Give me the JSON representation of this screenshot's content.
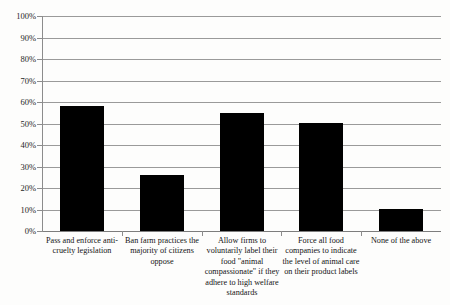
{
  "chart_data": {
    "type": "bar",
    "title": "",
    "subtitle": "",
    "xlabel": "",
    "ylabel": "",
    "ylim": [
      0,
      100
    ],
    "grid": true,
    "legend": "none",
    "orientation": "vertical",
    "bar_color": "#000000",
    "background_color": "#fdfdfc",
    "gridline_color": "#9a9a9a",
    "categories": [
      "Pass and enforce anti-cruelty legislation",
      "Ban farm practices the majority of citizens oppose",
      "Allow firms to voluntarily label their food \"animal compassionate\" if they adhere to high welfare standards",
      "Force all food companies to indicate the level of animal care on their product labels",
      "None of the above"
    ],
    "values": [
      58,
      26,
      55,
      50,
      10
    ],
    "value_unit": "%",
    "ytick_labels": [
      "0%",
      "10%",
      "20%",
      "30%",
      "40%",
      "50%",
      "60%",
      "70%",
      "80%",
      "90%",
      "100%"
    ],
    "ytick_values": [
      0,
      10,
      20,
      30,
      40,
      50,
      60,
      70,
      80,
      90,
      100
    ]
  }
}
